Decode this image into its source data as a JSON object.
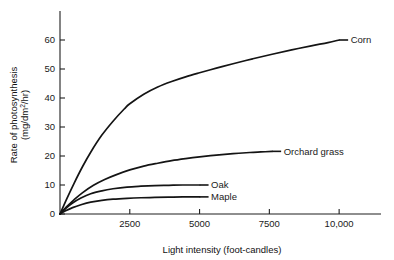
{
  "chart_data": {
    "type": "line",
    "title": "",
    "xlabel": "Light intensity (foot-candles)",
    "ylabel_line1": "Rate of photosynthesis",
    "ylabel_line2_pre": "(mg/dm",
    "ylabel_line2_sup": "2",
    "ylabel_line2_post": "/hr)",
    "ylabel": "Rate of photosynthesis (mg/dm2/hr)",
    "xlim": [
      0,
      11500
    ],
    "ylim": [
      0,
      70
    ],
    "grid": false,
    "legend_position": "inline-right-of-curve",
    "xticks": [
      2500,
      5000,
      7500,
      10000
    ],
    "xtick_labels": [
      "2500",
      "5000",
      "7500",
      "10,000"
    ],
    "yticks": [
      0,
      10,
      20,
      30,
      40,
      50,
      60
    ],
    "ytick_labels": [
      "0",
      "10",
      "20",
      "30",
      "40",
      "50",
      "60"
    ],
    "series": [
      {
        "name": "Corn",
        "label": "Corn",
        "color": "#141414",
        "x": [
          0,
          250,
          500,
          800,
          1100,
          1500,
          1900,
          2300,
          2500,
          3000,
          3500,
          4000,
          4500,
          5000,
          5600,
          6200,
          6900,
          7600,
          8300,
          9000,
          9600,
          10000
        ],
        "y": [
          0,
          5.4,
          10.5,
          16.2,
          21.3,
          27.2,
          32.0,
          36.2,
          38.0,
          41.3,
          43.8,
          45.7,
          47.3,
          48.7,
          50.3,
          51.8,
          53.5,
          55.1,
          56.6,
          58.0,
          59.1,
          60.0
        ]
      },
      {
        "name": "Orchard grass",
        "label": "Orchard grass",
        "color": "#141414",
        "x": [
          0,
          250,
          500,
          800,
          1200,
          1600,
          2000,
          2500,
          3000,
          3500,
          4000,
          4500,
          5000,
          5600,
          6200,
          6800,
          7200,
          7600
        ],
        "y": [
          0,
          2.6,
          4.9,
          7.3,
          9.9,
          11.9,
          13.5,
          15.2,
          16.5,
          17.5,
          18.4,
          19.1,
          19.7,
          20.3,
          20.8,
          21.2,
          21.4,
          21.6
        ]
      },
      {
        "name": "Oak",
        "label": "Oak",
        "color": "#141414",
        "x": [
          0,
          200,
          450,
          750,
          1100,
          1500,
          1900,
          2400,
          2900,
          3400,
          3900,
          4400,
          5000
        ],
        "y": [
          0,
          1.9,
          3.8,
          5.5,
          7.0,
          8.0,
          8.7,
          9.3,
          9.6,
          9.8,
          9.9,
          10.0,
          10.0
        ]
      },
      {
        "name": "Maple",
        "label": "Maple",
        "color": "#141414",
        "x": [
          0,
          200,
          450,
          750,
          1100,
          1500,
          1900,
          2400,
          2900,
          3400,
          3900,
          4400,
          5000
        ],
        "y": [
          0,
          1.1,
          2.2,
          3.2,
          4.1,
          4.7,
          5.1,
          5.4,
          5.6,
          5.7,
          5.8,
          5.9,
          5.9
        ]
      }
    ],
    "annotations": [
      {
        "text": "Corn",
        "anchor_x": 10000,
        "anchor_y": 60.0,
        "leader_length": 9
      },
      {
        "text": "Orchard grass",
        "anchor_x": 7600,
        "anchor_y": 21.6,
        "leader_length": 9
      },
      {
        "text": "Oak",
        "anchor_x": 5000,
        "anchor_y": 10.0,
        "leader_length": 9
      },
      {
        "text": "Maple",
        "anchor_x": 5000,
        "anchor_y": 5.9,
        "leader_length": 9
      }
    ]
  }
}
